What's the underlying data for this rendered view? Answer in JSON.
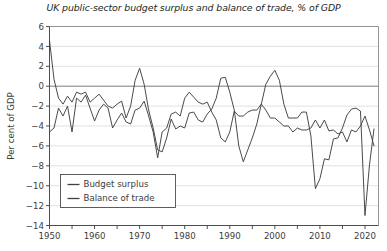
{
  "chart_data": {
    "type": "line",
    "title": "UK public-sector budget surplus and balance of trade, % of GDP",
    "xlabel": "",
    "ylabel": "Per cent of GDP",
    "xlim": [
      1950,
      2023
    ],
    "ylim": [
      -14,
      6
    ],
    "ytick_step": 2,
    "yticks": [
      6,
      4,
      2,
      0,
      -2,
      -4,
      -6,
      -8,
      -10,
      -12,
      -14
    ],
    "ytick_labels": [
      "6",
      "4",
      "2",
      "0",
      "−2",
      "−4",
      "−6",
      "−8",
      "−10",
      "−12",
      "−14"
    ],
    "xticks": [
      1950,
      1955,
      1960,
      1965,
      1970,
      1975,
      1980,
      1985,
      1990,
      1995,
      2000,
      2005,
      2010,
      2015,
      2020
    ],
    "xtick_labels_major": [
      "1950",
      "1960",
      "1970",
      "1980",
      "1990",
      "2000",
      "2010",
      "2020"
    ],
    "xticks_major": [
      1950,
      1960,
      1970,
      1980,
      1990,
      2000,
      2010,
      2020
    ],
    "grid": true,
    "grid_color": "#d9d9d9",
    "zero_line": true,
    "legend_position": "bottom-left",
    "line_color": "#404040",
    "series": [
      {
        "name": "Budget surplus",
        "color": "#404040",
        "x": [
          1950,
          1951,
          1952,
          1953,
          1954,
          1955,
          1956,
          1957,
          1958,
          1959,
          1960,
          1961,
          1962,
          1963,
          1964,
          1965,
          1966,
          1967,
          1968,
          1969,
          1970,
          1971,
          1972,
          1973,
          1974,
          1975,
          1976,
          1977,
          1978,
          1979,
          1980,
          1981,
          1982,
          1983,
          1984,
          1985,
          1986,
          1987,
          1988,
          1989,
          1990,
          1991,
          1992,
          1993,
          1994,
          1995,
          1996,
          1997,
          1998,
          1999,
          2000,
          2001,
          2002,
          2003,
          2004,
          2005,
          2006,
          2007,
          2008,
          2009,
          2010,
          2011,
          2012,
          2013,
          2014,
          2015,
          2016,
          2017,
          2018,
          2019,
          2020,
          2021,
          2022
        ],
        "values": [
          4.6,
          0.7,
          -1.2,
          -1.8,
          -1.0,
          -1.6,
          -0.6,
          -0.8,
          -0.6,
          -1.6,
          -1.2,
          -0.8,
          -1.4,
          -2.0,
          -2.2,
          -1.8,
          -1.5,
          -3.2,
          -2.0,
          0.6,
          1.8,
          0.2,
          -2.4,
          -4.2,
          -6.4,
          -6.6,
          -5.2,
          -3.3,
          -4.3,
          -4.0,
          -4.2,
          -2.7,
          -2.6,
          -3.4,
          -3.6,
          -2.8,
          -2.3,
          -1.2,
          0.8,
          0.9,
          -0.6,
          -2.4,
          -6.0,
          -7.6,
          -6.4,
          -5.2,
          -3.8,
          -1.8,
          0.2,
          1.0,
          1.6,
          0.6,
          -1.8,
          -3.2,
          -3.2,
          -3.2,
          -2.6,
          -2.6,
          -5.0,
          -10.3,
          -9.3,
          -7.3,
          -7.4,
          -5.3,
          -5.2,
          -4.2,
          -2.9,
          -2.3,
          -2.2,
          -2.5,
          -13.0,
          -7.9,
          -4.3
        ]
      },
      {
        "name": "Balance of trade",
        "color": "#404040",
        "x": [
          1950,
          1951,
          1952,
          1953,
          1954,
          1955,
          1956,
          1957,
          1958,
          1959,
          1960,
          1961,
          1962,
          1963,
          1964,
          1965,
          1966,
          1967,
          1968,
          1969,
          1970,
          1971,
          1972,
          1973,
          1974,
          1975,
          1976,
          1977,
          1978,
          1979,
          1980,
          1981,
          1982,
          1983,
          1984,
          1985,
          1986,
          1987,
          1988,
          1989,
          1990,
          1991,
          1992,
          1993,
          1994,
          1995,
          1996,
          1997,
          1998,
          1999,
          2000,
          2001,
          2002,
          2003,
          2004,
          2005,
          2006,
          2007,
          2008,
          2009,
          2010,
          2011,
          2012,
          2013,
          2014,
          2015,
          2016,
          2017,
          2018,
          2019,
          2020,
          2021,
          2022
        ],
        "values": [
          -4.6,
          -4.2,
          -2.2,
          -3.0,
          -2.0,
          -4.6,
          -1.2,
          -1.6,
          -0.9,
          -2.2,
          -3.5,
          -2.4,
          -1.8,
          -2.2,
          -4.2,
          -3.4,
          -2.7,
          -3.6,
          -3.8,
          -2.4,
          -2.2,
          -1.5,
          -3.0,
          -4.6,
          -7.2,
          -4.6,
          -4.2,
          -2.8,
          -2.6,
          -3.0,
          -1.2,
          -0.6,
          -1.1,
          -1.6,
          -1.8,
          -1.6,
          -2.6,
          -3.4,
          -5.2,
          -5.6,
          -4.6,
          -2.5,
          -3.0,
          -3.0,
          -2.6,
          -2.4,
          -2.4,
          -1.8,
          -2.4,
          -3.2,
          -3.2,
          -3.6,
          -4.0,
          -4.0,
          -4.6,
          -4.2,
          -4.4,
          -4.4,
          -4.2,
          -3.4,
          -4.2,
          -3.4,
          -4.5,
          -4.4,
          -4.8,
          -4.6,
          -5.6,
          -4.4,
          -4.6,
          -4.0,
          -3.0,
          -4.4,
          -6.0
        ]
      }
    ]
  },
  "legend": {
    "items": [
      {
        "label": "Budget surplus"
      },
      {
        "label": "Balance of trade"
      }
    ]
  },
  "axis": {
    "y_title": "Per cent of GDP"
  }
}
